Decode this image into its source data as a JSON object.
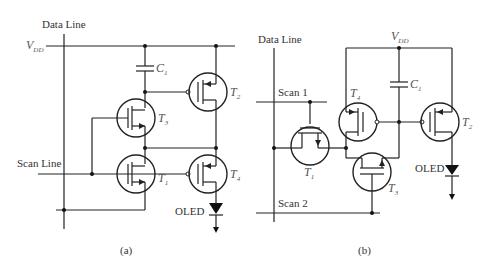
{
  "figure": {
    "panel_a": {
      "caption": "(a)",
      "labels": {
        "data_line": "Data Line",
        "vdd": "V",
        "vdd_sub": "DD",
        "scan_line": "Scan Line",
        "oled": "OLED",
        "c1": "C",
        "c1_sub": "1"
      },
      "transistors": [
        {
          "name": "T",
          "sub": "1",
          "type": "n"
        },
        {
          "name": "T",
          "sub": "2",
          "type": "p"
        },
        {
          "name": "T",
          "sub": "3",
          "type": "n"
        },
        {
          "name": "T",
          "sub": "4",
          "type": "p"
        }
      ]
    },
    "panel_b": {
      "caption": "(b)",
      "labels": {
        "data_line": "Data Line",
        "vdd": "V",
        "vdd_sub": "DD",
        "scan1": "Scan 1",
        "scan2": "Scan 2",
        "oled": "OLED",
        "c1": "C",
        "c1_sub": "1"
      },
      "transistors": [
        {
          "name": "T",
          "sub": "1",
          "type": "n"
        },
        {
          "name": "T",
          "sub": "2",
          "type": "p"
        },
        {
          "name": "T",
          "sub": "3",
          "type": "n"
        },
        {
          "name": "T",
          "sub": "4",
          "type": "p"
        }
      ]
    }
  }
}
